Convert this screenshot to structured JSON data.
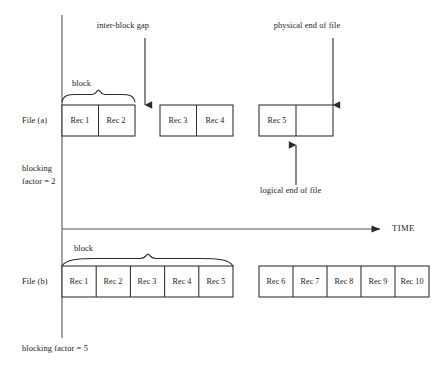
{
  "figure": {
    "title_absent": true,
    "axis": {
      "time_label": "TIME",
      "vertical_axis_name": "file-series-axis"
    },
    "annotations": {
      "inter_block_gap": "inter-block gap",
      "physical_end_of_file": "physical end of file",
      "logical_end_of_file": "logical end of file",
      "block_a": "block",
      "block_b": "block"
    },
    "rows": [
      {
        "name": "file-a",
        "label": "File (a)",
        "factor_label_line1": "blocking",
        "factor_label_line2": "factor = 2",
        "blocks": [
          {
            "name": "block-a-1",
            "records": [
              "Rec 1",
              "Rec 2"
            ],
            "empty_slots": 0
          },
          {
            "name": "block-a-2",
            "records": [
              "Rec 3",
              "Rec 4"
            ],
            "empty_slots": 0
          },
          {
            "name": "block-a-3",
            "records": [
              "Rec 5"
            ],
            "empty_slots": 1
          }
        ]
      },
      {
        "name": "file-b",
        "label": "File (b)",
        "factor_label": "blocking factor = 5",
        "blocks": [
          {
            "name": "block-b-1",
            "records": [
              "Rec 1",
              "Rec 2",
              "Rec 3",
              "Rec 4",
              "Rec 5"
            ],
            "empty_slots": 0
          },
          {
            "name": "block-b-2",
            "records": [
              "Rec 6",
              "Rec 7",
              "Rec 8",
              "Rec 9",
              "Rec 10"
            ],
            "empty_slots": 0
          }
        ]
      }
    ],
    "colors": {
      "stroke": "#2b2b2b",
      "text": "#1c1c1c",
      "background": "#ffffff"
    }
  }
}
